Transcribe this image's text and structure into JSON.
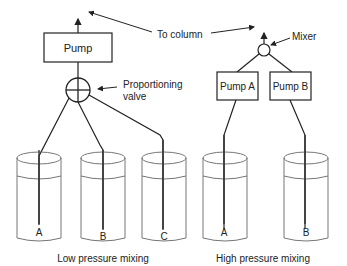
{
  "diagram": {
    "to_column_label": "To column",
    "low_pressure": {
      "pump_label": "Pump",
      "valve_label_line1": "Proportioning",
      "valve_label_line2": "valve",
      "reservoirs": [
        "A",
        "B",
        "C"
      ],
      "caption": "Low pressure mixing"
    },
    "high_pressure": {
      "mixer_label": "Mixer",
      "pump_a_label": "Pump A",
      "pump_b_label": "Pump B",
      "reservoirs": [
        "A",
        "B"
      ],
      "caption": "High pressure mixing"
    }
  }
}
